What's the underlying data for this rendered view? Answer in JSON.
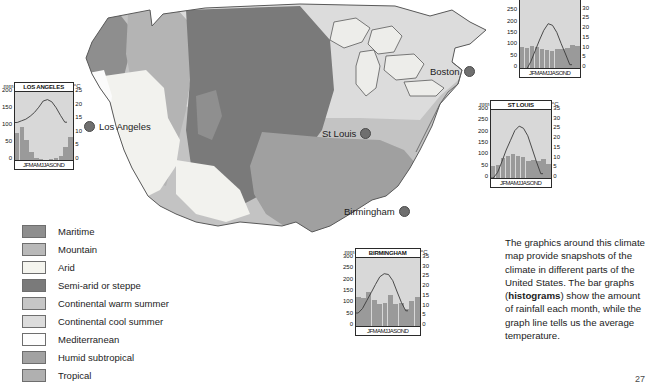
{
  "map": {
    "title": "United States climate map",
    "cities": [
      {
        "name": "Los Angeles",
        "x": 84,
        "y": 121,
        "side": "left"
      },
      {
        "name": "St Louis",
        "x": 322,
        "y": 128,
        "side": "right"
      },
      {
        "name": "Boston",
        "x": 452,
        "y": 66,
        "side": "right"
      },
      {
        "name": "Birmingham",
        "x": 344,
        "y": 206,
        "side": "right"
      }
    ],
    "region_colors": {
      "maritime": "#8e8e8e",
      "mountain": "#b4b4b4",
      "arid": "#f2f2ee",
      "semi_arid": "#7a7a7a",
      "continental_warm": "#c3c3c3",
      "continental_cool": "#dcdcdc",
      "mediterranean": "#fbfbfb",
      "humid_subtropical": "#a0a0a0",
      "tropical": "#adadad",
      "water": "#ededea",
      "outline": "#5a5a5a"
    }
  },
  "legend": {
    "items": [
      {
        "label": "Maritime",
        "color": "#8e8e8e"
      },
      {
        "label": "Mountain",
        "color": "#b9b9b9"
      },
      {
        "label": "Arid",
        "color": "#f4f4ee"
      },
      {
        "label": "Semi-arid or steppe",
        "color": "#7a7a7a"
      },
      {
        "label": "Continental warm summer",
        "color": "#c6c6c6"
      },
      {
        "label": "Continental cool summer",
        "color": "#dcdcdc"
      },
      {
        "label": "Mediterranean",
        "color": "#fdfdfd"
      },
      {
        "label": "Humid subtropical",
        "color": "#a2a2a2"
      },
      {
        "label": "Tropical",
        "color": "#b0b0b0"
      }
    ]
  },
  "caption": {
    "part1": "The graphics around this climate map provide snapshots of the climate in different parts of the United States. The bar graphs (",
    "bold": "histograms",
    "part2": ") show the amount of rainfall each month, while the graph line tells us the average temperature.",
    "page_number": "27"
  },
  "chart_data": [
    {
      "id": "los_angeles",
      "type": "bar",
      "title": "LOS ANGELES",
      "xlabel": "",
      "ylabel": "mm",
      "y2label": "°C",
      "ylim": [
        0,
        200
      ],
      "y2lim": [
        0,
        25
      ],
      "yticks": [
        "200",
        "150",
        "100",
        "50",
        "0"
      ],
      "y2ticks": [
        "25",
        "20",
        "15",
        "10",
        "5",
        "0"
      ],
      "categories": [
        "J",
        "F",
        "M",
        "A",
        "M",
        "J",
        "J",
        "A",
        "S",
        "O",
        "N",
        "D"
      ],
      "month_labels": "JFMAMJJASOND",
      "series": [
        {
          "name": "Rainfall",
          "unit": "mm",
          "kind": "bar",
          "values": [
            79,
            97,
            60,
            25,
            6,
            2,
            0,
            2,
            6,
            12,
            37,
            69
          ]
        },
        {
          "name": "Temperature",
          "unit": "°C",
          "kind": "line",
          "values": [
            13.8,
            14.4,
            15.0,
            16.1,
            17.5,
            19.4,
            21.7,
            22.2,
            21.4,
            19.2,
            16.4,
            13.9
          ]
        }
      ]
    },
    {
      "id": "boston",
      "type": "bar",
      "title": "BOSTON",
      "xlabel": "",
      "ylabel": "mm",
      "y2label": "°C",
      "ylim": [
        0,
        300
      ],
      "y2lim": [
        0,
        35
      ],
      "yticks": [
        "300",
        "250",
        "200",
        "150",
        "100",
        "50",
        "0"
      ],
      "y2ticks": [
        "35",
        "30",
        "25",
        "20",
        "15",
        "10",
        "5",
        "0"
      ],
      "categories": [
        "J",
        "F",
        "M",
        "A",
        "M",
        "J",
        "J",
        "A",
        "S",
        "O",
        "N",
        "D"
      ],
      "month_labels": "JFMAMJJASOND",
      "series": [
        {
          "name": "Rainfall",
          "unit": "mm",
          "kind": "bar",
          "values": [
            91,
            89,
            97,
            92,
            84,
            81,
            77,
            83,
            85,
            89,
            100,
            97
          ]
        },
        {
          "name": "Temperature",
          "unit": "°C",
          "kind": "line",
          "values": [
            -1.5,
            -0.8,
            3.3,
            8.9,
            14.4,
            19.4,
            22.8,
            22.0,
            18.3,
            12.5,
            7.2,
            1.7
          ]
        }
      ]
    },
    {
      "id": "st_louis",
      "type": "bar",
      "title": "ST LOUIS",
      "xlabel": "",
      "ylabel": "mm",
      "y2label": "°C",
      "ylim": [
        0,
        300
      ],
      "y2lim": [
        0,
        35
      ],
      "yticks": [
        "300",
        "250",
        "200",
        "150",
        "100",
        "50",
        "0"
      ],
      "y2ticks": [
        "35",
        "30",
        "25",
        "20",
        "15",
        "10",
        "5",
        "0"
      ],
      "categories": [
        "J",
        "F",
        "M",
        "A",
        "M",
        "J",
        "J",
        "A",
        "S",
        "O",
        "N",
        "D"
      ],
      "month_labels": "JFMAMJJASOND",
      "series": [
        {
          "name": "Rainfall",
          "unit": "mm",
          "kind": "bar",
          "values": [
            52,
            58,
            88,
            98,
            104,
            96,
            93,
            75,
            78,
            73,
            84,
            64
          ]
        },
        {
          "name": "Temperature",
          "unit": "°C",
          "kind": "line",
          "values": [
            0.0,
            2.8,
            8.3,
            14.4,
            19.4,
            24.4,
            26.7,
            25.6,
            21.7,
            15.0,
            8.3,
            2.2
          ]
        }
      ]
    },
    {
      "id": "birmingham",
      "type": "bar",
      "title": "BIRMINGHAM",
      "xlabel": "",
      "ylabel": "mm",
      "y2label": "°C",
      "ylim": [
        0,
        300
      ],
      "y2lim": [
        0,
        35
      ],
      "yticks": [
        "300",
        "250",
        "200",
        "150",
        "100",
        "50",
        "0"
      ],
      "y2ticks": [
        "35",
        "30",
        "25",
        "20",
        "15",
        "10",
        "5",
        "0"
      ],
      "categories": [
        "J",
        "F",
        "M",
        "A",
        "M",
        "J",
        "J",
        "A",
        "S",
        "O",
        "N",
        "D"
      ],
      "month_labels": "JFMAMJJASOND",
      "series": [
        {
          "name": "Rainfall",
          "unit": "mm",
          "kind": "bar",
          "values": [
            130,
            125,
            150,
            115,
            95,
            100,
            135,
            95,
            100,
            75,
            110,
            130
          ]
        },
        {
          "name": "Temperature",
          "unit": "°C",
          "kind": "line",
          "values": [
            6.7,
            9.0,
            13.1,
            17.2,
            21.4,
            25.3,
            26.9,
            26.5,
            23.3,
            17.5,
            12.0,
            7.8
          ]
        }
      ]
    }
  ]
}
